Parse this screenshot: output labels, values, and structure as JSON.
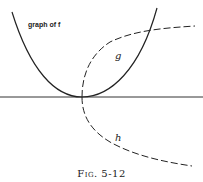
{
  "figure": {
    "caption": "Fig. 5-12",
    "labels": {
      "f": "graph of f",
      "g": "g",
      "h": "h"
    }
  },
  "curves": [
    {
      "name": "f",
      "style": "solid",
      "description": "upward parabola with vertex on horizontal axis"
    },
    {
      "name": "g",
      "style": "dashed",
      "description": "upper branch of sideways parabola (inverse relation) opening right"
    },
    {
      "name": "h",
      "style": "dashed",
      "description": "lower branch of sideways parabola opening right"
    }
  ],
  "axis": {
    "orientation": "horizontal",
    "style": "solid"
  },
  "colors": {
    "ink": "#222222",
    "background": "#ffffff"
  }
}
